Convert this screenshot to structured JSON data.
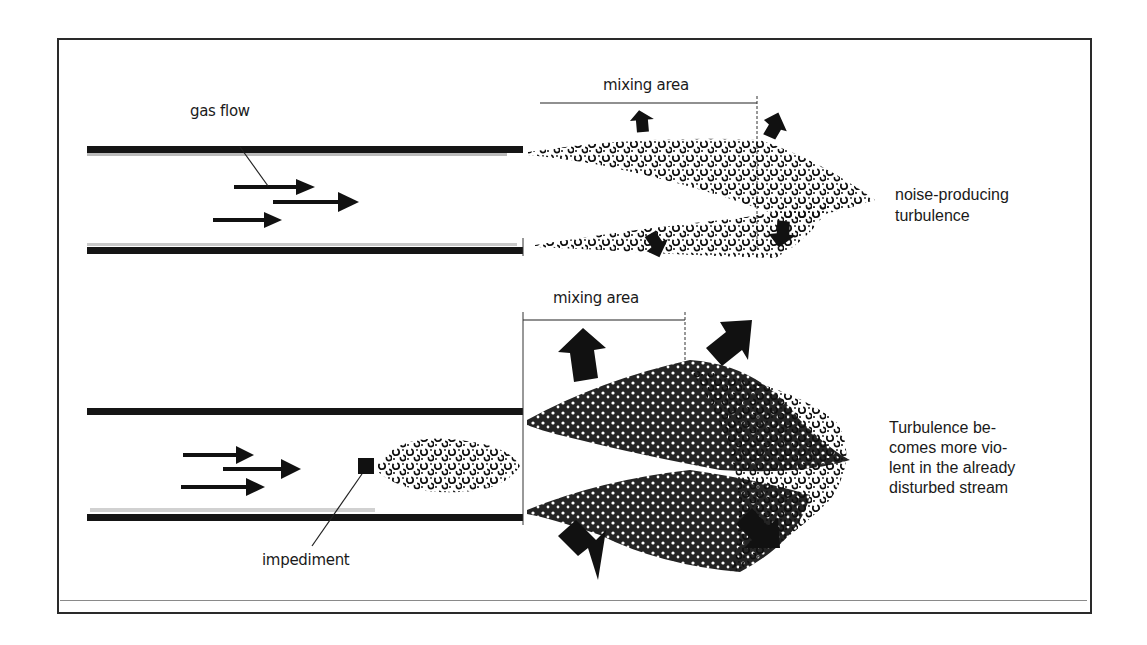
{
  "figure": {
    "type": "schematic",
    "panels": [
      {
        "id": "top",
        "labels": {
          "flow": "gas flow",
          "mixing": "mixing area",
          "result_line1": "noise-producing",
          "result_line2": "turbulence"
        },
        "flow_arrows": 3,
        "expansion_arrows": 4
      },
      {
        "id": "bottom",
        "labels": {
          "mixing": "mixing area",
          "obstacle": "impediment",
          "result_line1": "Turbulence be-",
          "result_line2": "comes more vio-",
          "result_line3": "lent in the already",
          "result_line4": "disturbed stream"
        },
        "flow_arrows": 3,
        "expansion_arrows": 4
      }
    ]
  },
  "colors": {
    "ink": "#1a1a1a",
    "frame": "#2a2a2a",
    "background": "#ffffff"
  }
}
